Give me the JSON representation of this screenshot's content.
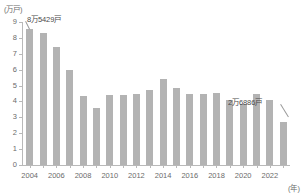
{
  "chart_data": {
    "type": "bar",
    "title": "",
    "subtitle": "",
    "xlabel": "(年)",
    "ylabel": "(万戸)",
    "ylim": [
      0,
      9
    ],
    "grid": false,
    "legend": "none",
    "categories": [
      "2004",
      "2005",
      "2006",
      "2007",
      "2008",
      "2009",
      "2010",
      "2011",
      "2012",
      "2013",
      "2014",
      "2015",
      "2016",
      "2017",
      "2018",
      "2019",
      "2020",
      "2021",
      "2022",
      "2023"
    ],
    "tick_labels_x": [
      "2004",
      "2006",
      "2008",
      "2010",
      "2012",
      "2014",
      "2016",
      "2018",
      "2020",
      "2022"
    ],
    "tick_labels_y": [
      "0",
      "1",
      "2",
      "3",
      "4",
      "5",
      "6",
      "7",
      "8",
      "9"
    ],
    "values": [
      8.54,
      8.3,
      7.4,
      6.0,
      4.35,
      3.6,
      4.4,
      4.4,
      4.5,
      4.75,
      5.4,
      4.85,
      4.5,
      4.5,
      4.55,
      4.1,
      3.85,
      4.45,
      4.1,
      2.69
    ],
    "bar_color": "#b3b3b3",
    "axis_color": "#b9b9b9",
    "text_color": "#6b6b6b",
    "annotations": [
      {
        "text": "8万5429戸",
        "category": "2004",
        "value": 8.5429
      },
      {
        "text": "2万6886戸",
        "category": "2023",
        "value": 2.6886
      }
    ]
  }
}
